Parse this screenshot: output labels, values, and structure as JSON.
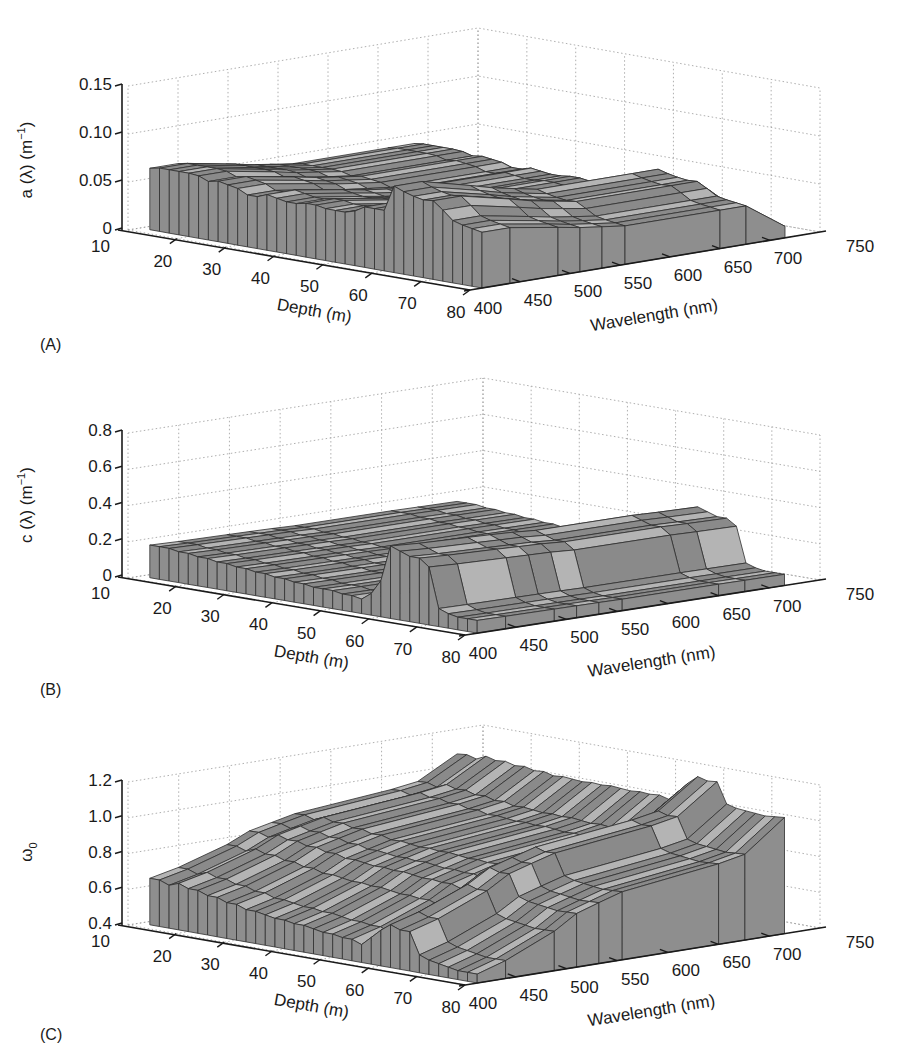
{
  "figure": {
    "background": "#ffffff",
    "surface_colors": {
      "side": "#8e8e8e",
      "top_dark": "#8a8a8a",
      "top_light": "#b4b4b4",
      "edge": "#2e2e2e"
    }
  },
  "chart_data": [
    {
      "panel": "(A)",
      "type": "surface3d",
      "title": "",
      "xlabel": "Depth (m)",
      "ylabel": "Wavelength (nm)",
      "zlabel": "a (λ) (m⁻¹)",
      "x_ticks": [
        "10",
        "20",
        "30",
        "40",
        "50",
        "60",
        "70",
        "80"
      ],
      "y_ticks": [
        "400",
        "450",
        "500",
        "550",
        "600",
        "650",
        "700",
        "750"
      ],
      "z_ticks": [
        "0",
        "0.05",
        "0.10",
        "0.15"
      ],
      "xlim": [
        10,
        80
      ],
      "ylim": [
        400,
        750
      ],
      "zlim": [
        0,
        0.15
      ],
      "grid": true,
      "depth": [
        12,
        14,
        16,
        18,
        20,
        22,
        24,
        26,
        28,
        30,
        32,
        34,
        36,
        38,
        40,
        42,
        44,
        46,
        48,
        50,
        52,
        54,
        56,
        58,
        60,
        62,
        64,
        66,
        68,
        70,
        72,
        74,
        76,
        78,
        80
      ],
      "wavelength": [
        412,
        440,
        488,
        510,
        532,
        555,
        650,
        676,
        715
      ],
      "front_profile_at_412nm": [
        0.064,
        0.066,
        0.066,
        0.066,
        0.066,
        0.065,
        0.061,
        0.063,
        0.061,
        0.059,
        0.054,
        0.054,
        0.058,
        0.056,
        0.054,
        0.054,
        0.056,
        0.056,
        0.054,
        0.054,
        0.054,
        0.057,
        0.063,
        0.063,
        0.063,
        0.09,
        0.086,
        0.083,
        0.081,
        0.082,
        0.074,
        0.065,
        0.062,
        0.06,
        0.058
      ],
      "spectral_profile_at_80m": [
        0.058,
        0.058,
        0.05,
        0.046,
        0.043,
        0.04,
        0.04,
        0.04,
        0.012
      ],
      "note": "Absorption peaks near 60-65 m depth (~0.09 m^-1 at 412 nm) and decreases with wavelength toward ~0.01 at 715 nm"
    },
    {
      "panel": "(B)",
      "type": "surface3d",
      "title": "",
      "xlabel": "Depth (m)",
      "ylabel": "Wavelength (nm)",
      "zlabel": "c (λ) (m⁻¹)",
      "x_ticks": [
        "10",
        "20",
        "30",
        "40",
        "50",
        "60",
        "70",
        "80"
      ],
      "y_ticks": [
        "400",
        "450",
        "500",
        "550",
        "600",
        "650",
        "700",
        "750"
      ],
      "z_ticks": [
        "0",
        "0.2",
        "0.4",
        "0.6",
        "0.8"
      ],
      "xlim": [
        10,
        80
      ],
      "ylim": [
        400,
        750
      ],
      "zlim": [
        0,
        0.8
      ],
      "grid": true,
      "depth": [
        12,
        14,
        16,
        18,
        20,
        22,
        24,
        26,
        28,
        30,
        32,
        34,
        36,
        38,
        40,
        42,
        44,
        46,
        48,
        50,
        52,
        54,
        56,
        58,
        60,
        62,
        64,
        66,
        68,
        70,
        72,
        74,
        76,
        78,
        80
      ],
      "wavelength": [
        412,
        440,
        488,
        510,
        532,
        555,
        650,
        676,
        715
      ],
      "front_profile_at_412nm": [
        0.18,
        0.18,
        0.18,
        0.17,
        0.17,
        0.16,
        0.16,
        0.15,
        0.15,
        0.14,
        0.14,
        0.13,
        0.13,
        0.12,
        0.12,
        0.11,
        0.11,
        0.1,
        0.1,
        0.1,
        0.09,
        0.09,
        0.08,
        0.12,
        0.2,
        0.4,
        0.38,
        0.36,
        0.36,
        0.32,
        0.1,
        0.08,
        0.07,
        0.07,
        0.07
      ],
      "spectral_profile_at_66m": [
        0.38,
        0.36,
        0.34,
        0.33,
        0.32,
        0.3,
        0.3,
        0.29,
        0.28
      ],
      "note": "Beam attenuation shows a sharp maximum (~0.4 m^-1) between ~60-70 m depth, low elsewhere (~0.1-0.2)"
    },
    {
      "panel": "(C)",
      "type": "surface3d",
      "title": "",
      "xlabel": "Depth (m)",
      "ylabel": "Wavelength (nm)",
      "zlabel": "ω₀",
      "x_ticks": [
        "10",
        "20",
        "30",
        "40",
        "50",
        "60",
        "70",
        "80"
      ],
      "y_ticks": [
        "400",
        "450",
        "500",
        "550",
        "600",
        "650",
        "700",
        "750"
      ],
      "z_ticks": [
        "0.4",
        "0.6",
        "0.8",
        "1.0",
        "1.2"
      ],
      "xlim": [
        10,
        80
      ],
      "ylim": [
        400,
        750
      ],
      "zlim": [
        0.4,
        1.2
      ],
      "grid": true,
      "depth": [
        12,
        14,
        16,
        18,
        20,
        22,
        24,
        26,
        28,
        30,
        32,
        34,
        36,
        38,
        40,
        42,
        44,
        46,
        48,
        50,
        52,
        54,
        56,
        58,
        60,
        62,
        64,
        66,
        68,
        70,
        72,
        74,
        76,
        78,
        80
      ],
      "wavelength": [
        412,
        440,
        488,
        510,
        532,
        555,
        650,
        676,
        715
      ],
      "front_profile_at_412nm": [
        0.66,
        0.66,
        0.64,
        0.66,
        0.64,
        0.64,
        0.62,
        0.62,
        0.6,
        0.6,
        0.58,
        0.58,
        0.57,
        0.56,
        0.56,
        0.55,
        0.55,
        0.54,
        0.53,
        0.53,
        0.52,
        0.52,
        0.5,
        0.55,
        0.6,
        0.64,
        0.62,
        0.62,
        0.5,
        0.48,
        0.47,
        0.46,
        0.45,
        0.45,
        0.45
      ],
      "spectral_profile_at_80m": [
        0.45,
        0.5,
        0.62,
        0.7,
        0.74,
        0.78,
        0.85,
        0.88,
        1.05
      ],
      "note": "Single-scattering albedo increases with wavelength, reaching ~1.1 at 715 nm; front edge ~0.5-0.66"
    }
  ],
  "panels": {
    "a": {
      "label": "(A)",
      "zlabel_main": "a (λ) (m",
      "zlabel_sup": "−1",
      "zlabel_tail": ")"
    },
    "b": {
      "label": "(B)",
      "zlabel_main": "c (λ) (m",
      "zlabel_sup": "−1",
      "zlabel_tail": ")"
    },
    "c": {
      "label": "(C)",
      "zlabel_main": "ω",
      "zlabel_sub": "0"
    }
  }
}
